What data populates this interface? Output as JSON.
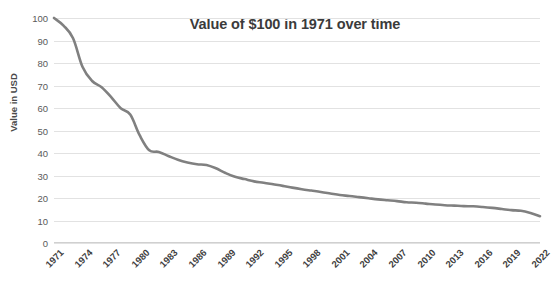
{
  "chart_data": {
    "type": "line",
    "title": "Value of $100 in 1971 over time",
    "xlabel": "",
    "ylabel": "Value in USD",
    "ylim": [
      0,
      100
    ],
    "ytick_step": 10,
    "yticks": [
      100,
      90,
      80,
      70,
      60,
      50,
      40,
      30,
      20,
      10,
      0
    ],
    "grid": true,
    "legend": "none",
    "xlim": [
      1971,
      2022
    ],
    "xtick_labels": [
      "1971",
      "1974",
      "1977",
      "1980",
      "1983",
      "1986",
      "1989",
      "1992",
      "1995",
      "1998",
      "2001",
      "2004",
      "2007",
      "2010",
      "2013",
      "2016",
      "2019",
      "2022"
    ],
    "xtick_rotation_deg": -45,
    "series": [
      {
        "name": "Value in USD",
        "color": "#808080",
        "x": [
          1971,
          1972,
          1973,
          1974,
          1975,
          1976,
          1977,
          1978,
          1979,
          1980,
          1981,
          1982,
          1983,
          1984,
          1985,
          1986,
          1987,
          1988,
          1989,
          1990,
          1991,
          1992,
          1993,
          1994,
          1995,
          1996,
          1997,
          1998,
          1999,
          2000,
          2001,
          2002,
          2003,
          2004,
          2005,
          2006,
          2007,
          2008,
          2009,
          2010,
          2011,
          2012,
          2013,
          2014,
          2015,
          2016,
          2017,
          2018,
          2019,
          2020,
          2021,
          2022
        ],
        "values": [
          100,
          96.6,
          91.0,
          78.2,
          72.0,
          69.2,
          64.8,
          59.9,
          57.1,
          47.8,
          41.2,
          40.5,
          38.7,
          37.0,
          35.8,
          35.0,
          34.7,
          33.2,
          31.1,
          29.4,
          28.4,
          27.4,
          26.8,
          26.1,
          25.4,
          24.6,
          23.9,
          23.3,
          22.7,
          22.0,
          21.3,
          20.9,
          20.4,
          19.9,
          19.4,
          19.0,
          18.6,
          18.1,
          17.9,
          17.5,
          17.1,
          16.8,
          16.6,
          16.4,
          16.3,
          16.0,
          15.6,
          15.1,
          14.6,
          14.3,
          13.3,
          11.9
        ]
      }
    ]
  },
  "colors": {
    "line": "#808080",
    "grid": "#e2e2e2",
    "title_text": "#3b3b3b",
    "tick_text": "#5a5a5a"
  }
}
